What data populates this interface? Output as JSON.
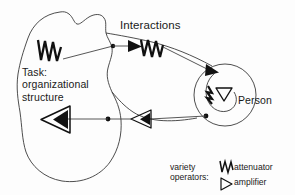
{
  "diagram": {
    "title_labels": {
      "interactions": "Interactions",
      "task": "Task:\norganizational\nstructure",
      "person": "Person"
    },
    "legend": {
      "title": "variety operators:",
      "attenuator_label": "attenuator",
      "amplifier_label": "amplifier",
      "attenuator_icon": "zigzag-attenuator-icon",
      "amplifier_icon": "open-triangle-amplifier-icon"
    },
    "colors": {
      "stroke": "#3a3a3a",
      "fill_dark": "#111111",
      "background": "#fdfdfd",
      "text": "#1a1a1a"
    },
    "elements": {
      "task_blob": "task-organizational-structure-boundary",
      "interactions_region": "interactions-lens-region",
      "person_circle": "person-boundary",
      "attenuator_task": "attenuator-in-task",
      "attenuator_interactions": "attenuator-in-interactions",
      "attenuator_person": "attenuator-in-person",
      "amplifier_task": "amplifier-into-task",
      "amplifier_interactions": "amplifier-in-interactions",
      "amplifier_person": "amplifier-in-person",
      "nodes": [
        "node-top-task-edge",
        "node-bottom-task-edge",
        "node-person-left"
      ]
    }
  }
}
